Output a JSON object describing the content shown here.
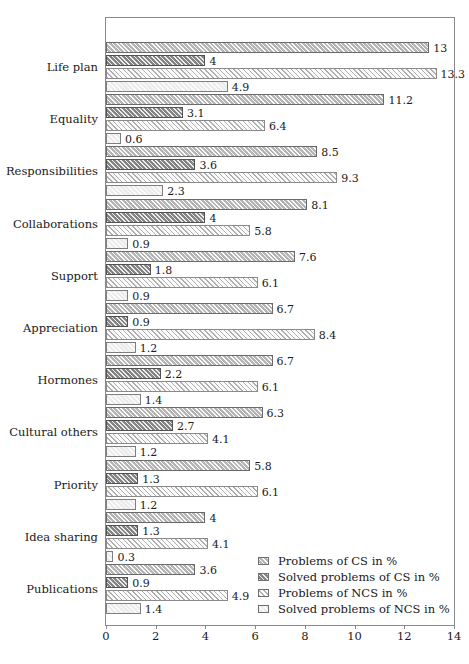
{
  "chart_data": {
    "type": "bar",
    "orientation": "horizontal",
    "title": "",
    "subtitle": "",
    "xlabel": "",
    "ylabel": "",
    "xlim": [
      0,
      14
    ],
    "xticks": [
      0,
      2,
      4,
      6,
      8,
      10,
      12,
      14
    ],
    "grid": false,
    "legend_position": "inside-bottom-right",
    "categories": [
      "Life plan",
      "Equality",
      "Responsibilities",
      "Collaborations",
      "Support",
      "Appreciation",
      "Hormones",
      "Cultural others",
      "Priority",
      "Idea sharing",
      "Publications"
    ],
    "series": [
      {
        "name": "Problems of CS in %",
        "values": [
          13,
          11.2,
          8.5,
          8.1,
          7.6,
          6.7,
          6.7,
          6.3,
          5.8,
          4,
          3.6
        ],
        "labels": [
          "13",
          "11.2",
          "8.5",
          "8.1",
          "7.6",
          "6.7",
          "6.7",
          "6.3",
          "5.8",
          "4",
          "3.6"
        ]
      },
      {
        "name": "Solved problems of CS in %",
        "values": [
          4,
          3.1,
          3.6,
          4,
          1.8,
          0.9,
          2.2,
          2.7,
          1.3,
          1.3,
          0.9
        ],
        "labels": [
          "4",
          "3.1",
          "3.6",
          "4",
          "1.8",
          "0.9",
          "2.2",
          "2.7",
          "1.3",
          "1.3",
          "0.9"
        ]
      },
      {
        "name": "Problems of NCS in %",
        "values": [
          13.3,
          6.4,
          9.3,
          5.8,
          6.1,
          8.4,
          6.1,
          4.1,
          6.1,
          4.1,
          4.9
        ],
        "labels": [
          "13.3",
          "6.4",
          "9.3",
          "5.8",
          "6.1",
          "8.4",
          "6.1",
          "4.1",
          "6.1",
          "4.1",
          "4.9"
        ]
      },
      {
        "name": "Solved problems of NCS in %",
        "values": [
          4.9,
          0.6,
          2.3,
          0.9,
          0.9,
          1.2,
          1.4,
          1.2,
          1.2,
          0.3,
          1.4
        ],
        "labels": [
          "4.9",
          "0.6",
          "2.3",
          "0.9",
          "0.9",
          "1.2",
          "1.4",
          "1.2",
          "1.2",
          "0.3",
          "1.4"
        ]
      }
    ]
  },
  "legend": {
    "items": [
      {
        "label": "Problems of CS in %",
        "swatch": "s0"
      },
      {
        "label": "Solved problems of CS in %",
        "swatch": "s1"
      },
      {
        "label": "Problems of NCS in %",
        "swatch": "s2"
      },
      {
        "label": "Solved problems of NCS in %",
        "swatch": "s3"
      }
    ]
  }
}
